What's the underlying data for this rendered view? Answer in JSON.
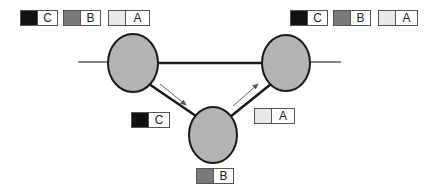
{
  "colors": {
    "C": "#111111",
    "B": "#7a7a7a",
    "A": "#e8e8e8",
    "node_fill": "#b3b3b3",
    "node_stroke": "#1a1a1a",
    "arrow": "#555555"
  },
  "nodes": [
    {
      "id": "left",
      "cx": 133,
      "cy": 63,
      "rx": 25,
      "ry": 29
    },
    {
      "id": "right",
      "cx": 286,
      "cy": 63,
      "rx": 24,
      "ry": 28
    },
    {
      "id": "bottom",
      "cx": 213,
      "cy": 135,
      "rx": 24,
      "ry": 28
    }
  ],
  "badges": [
    {
      "group": "top-left",
      "label": "C",
      "x": 20,
      "y": 10,
      "w": 36
    },
    {
      "group": "top-left",
      "label": "B",
      "x": 63,
      "y": 10,
      "w": 36
    },
    {
      "group": "top-left",
      "label": "A",
      "x": 108,
      "y": 10,
      "w": 40
    },
    {
      "group": "top-right",
      "label": "C",
      "x": 290,
      "y": 10,
      "w": 36
    },
    {
      "group": "top-right",
      "label": "B",
      "x": 333,
      "y": 10,
      "w": 36
    },
    {
      "group": "top-right",
      "label": "A",
      "x": 378,
      "y": 10,
      "w": 38
    },
    {
      "group": "middle-left",
      "label": "C",
      "x": 131,
      "y": 112,
      "w": 37
    },
    {
      "group": "middle-right",
      "label": "A",
      "x": 254,
      "y": 108,
      "w": 39
    },
    {
      "group": "bottom",
      "label": "B",
      "x": 196,
      "y": 168,
      "w": 36
    }
  ]
}
